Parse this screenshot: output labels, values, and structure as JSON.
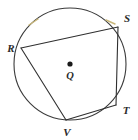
{
  "figure": {
    "background_color": "#ffffff",
    "stroke_color": "#3a3a3a",
    "chord_color": "#2f2f2f",
    "tick_color": "#c9b77a",
    "label_color": "#2b2b2b"
  },
  "circle": {
    "center_x": 70,
    "center_y": 64,
    "radius": 56,
    "stroke_width": 1.1
  },
  "center_point": {
    "name": "Q",
    "label": "Q",
    "dot_x": 70,
    "dot_y": 64,
    "dot_radius": 2.6,
    "label_x": 70,
    "label_y": 79
  },
  "vertices": [
    {
      "name": "R",
      "label": "R",
      "x": 21,
      "y": 48,
      "label_x": 11,
      "label_y": 52,
      "anchor": "middle"
    },
    {
      "name": "S",
      "label": "S",
      "x": 118,
      "y": 27,
      "label_x": 127,
      "label_y": 22,
      "anchor": "middle"
    },
    {
      "name": "T",
      "label": "T",
      "x": 116,
      "y": 105,
      "label_x": 126,
      "label_y": 114,
      "anchor": "middle"
    },
    {
      "name": "V",
      "label": "V",
      "x": 66,
      "y": 120,
      "label_x": 67,
      "label_y": 136,
      "anchor": "middle"
    }
  ],
  "sides": [
    {
      "name": "RS",
      "from": "R",
      "to": "S",
      "x1": 21,
      "y1": 48,
      "x2": 118,
      "y2": 27
    },
    {
      "name": "ST",
      "from": "S",
      "to": "T",
      "x1": 118,
      "y1": 27,
      "x2": 116,
      "y2": 105
    },
    {
      "name": "TV",
      "from": "T",
      "to": "V",
      "x1": 116,
      "y1": 105,
      "x2": 66,
      "y2": 120
    },
    {
      "name": "VR",
      "from": "V",
      "to": "R",
      "x1": 66,
      "y1": 120,
      "x2": 21,
      "y2": 48
    }
  ],
  "arc_ticks": [
    {
      "name": "tick-arc-upper-left",
      "x1": 29,
      "y1": 25,
      "x2": 38,
      "y2": 19
    },
    {
      "name": "tick-arc-upper-right",
      "x1": 106,
      "y1": 20,
      "x2": 115,
      "y2": 24
    }
  ]
}
